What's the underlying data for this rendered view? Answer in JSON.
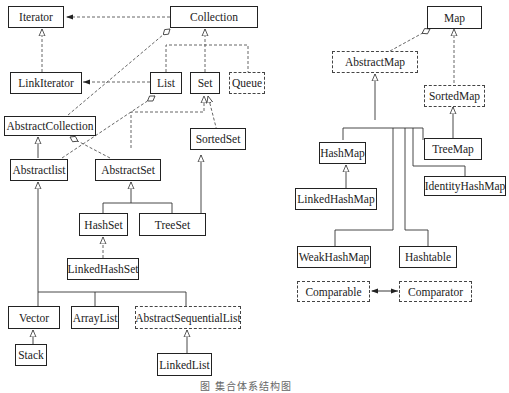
{
  "collection_diagram": {
    "nodes": {
      "iterator": "Iterator",
      "collection": "Collection",
      "link_iterator": "LinkIterator",
      "list": "List",
      "set": "Set",
      "queue": "Queue",
      "abstract_collection": "AbstractCollection",
      "sorted_set": "SortedSet",
      "abstract_list": "Abstractlist",
      "abstract_set": "AbstractSet",
      "hash_set": "HashSet",
      "tree_set": "TreeSet",
      "linked_hash_set": "LinkedHashSet",
      "vector": "Vector",
      "array_list": "ArrayList",
      "abstract_sequential_list": "AbstractSequentialList",
      "stack": "Stack",
      "linked_list": "LinkedList"
    }
  },
  "map_diagram": {
    "nodes": {
      "map": "Map",
      "abstract_map": "AbstractMap",
      "sorted_map": "SortedMap",
      "hash_map": "HashMap",
      "tree_map": "TreeMap",
      "linked_hash_map": "LinkedHashMap",
      "identity_hash_map": "IdentityHashMap",
      "weak_hash_map": "WeakHashMap",
      "hashtable": "Hashtable",
      "comparable": "Comparable",
      "comparator": "Comparator"
    }
  },
  "caption": "图   集合体系结构图"
}
